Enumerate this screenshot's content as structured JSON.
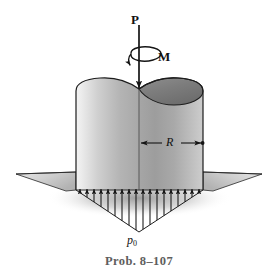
{
  "figure": {
    "caption": "Prob. 8–107",
    "type": "engineering-free-body-diagram"
  },
  "labels": {
    "force_P": "P",
    "moment_M": "M",
    "radius_R": "R",
    "pressure_p": "p",
    "pressure_subscript": "0"
  },
  "geometry": {
    "canvas_width": 278,
    "canvas_height": 280,
    "cylinder": {
      "left_x": 76,
      "right_x": 203,
      "top_y": 78,
      "bottom_y": 190,
      "center_x": 139,
      "radius_px": 64,
      "top_ellipse_ry": 13
    },
    "ground_line_y": 175,
    "pressure_apex_y": 232,
    "pressure_arrow_count": 18
  },
  "colors": {
    "background": "#ffffff",
    "outline": "#1a1a1a",
    "caption_text": "#5e5e5e",
    "label_text": "#111111",
    "cylinder_light": "#f2f2f2",
    "cylinder_mid": "#b8b8b8",
    "cylinder_dark": "#6f6f6f",
    "top_face_dark": "#7a7a7a",
    "ground_light": "#d9d9d9",
    "ground_mid": "#b0b0b0",
    "shadow": "#9a9a9a"
  }
}
